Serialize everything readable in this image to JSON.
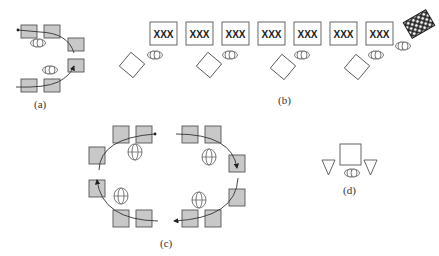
{
  "figure": {
    "panels": [
      {
        "id": "a",
        "label": "(a)",
        "description": "Two rows of gray workstations with operator ellipses and curved flow arrows forming a U-shape"
      },
      {
        "id": "b",
        "label": "(b)",
        "description": "Line of seven XXX-labeled machines with operators and rotated diamond stations, ending in a crosshatched pallet"
      },
      {
        "id": "c",
        "label": "(c)",
        "description": "Oval loop of twelve gray workstations with four operators and clockwise flow arrows"
      },
      {
        "id": "d",
        "label": "(d)",
        "description": "Single cell: square machine flanked by two triangles with one operator"
      }
    ],
    "machine_text": "XXX",
    "machine_count_b": 7,
    "colors": {
      "station_fill": "#c8c8c8",
      "outline": "#555555",
      "arrow": "#333333",
      "background": "#ffffff"
    }
  }
}
